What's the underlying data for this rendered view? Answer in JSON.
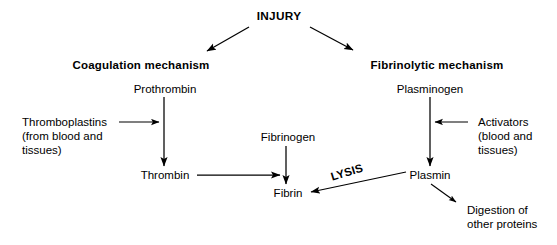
{
  "diagram": {
    "title_node": "INJURY",
    "branches": [
      {
        "id": "coagulation",
        "label": "Coagulation mechanism"
      },
      {
        "id": "fibrinolytic",
        "label": "Fibrinolytic mechanism"
      }
    ],
    "nodes": {
      "injury": "INJURY",
      "coagulation_mechanism": "Coagulation mechanism",
      "fibrinolytic_mechanism": "Fibrinolytic mechanism",
      "prothrombin": "Prothrombin",
      "plasminogen": "Plasminogen",
      "thromboplastins_line1": "Thromboplastins",
      "thromboplastins_line2": "(from blood and",
      "thromboplastins_line3": "tissues)",
      "activators_line1": "Activators",
      "activators_line2": "(blood and",
      "activators_line3": "tissues)",
      "fibrinogen": "Fibrinogen",
      "thrombin": "Thrombin",
      "fibrin": "Fibrin",
      "plasmin": "Plasmin",
      "lysis": "LYSIS",
      "digestion_line1": "Digestion of",
      "digestion_line2": "other proteins"
    },
    "colors": {
      "background": "#ffffff",
      "ink": "#000000"
    }
  }
}
